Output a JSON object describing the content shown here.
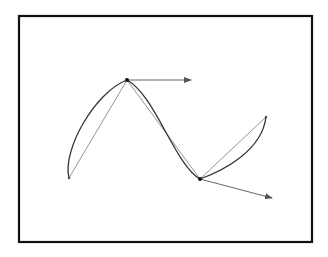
{
  "diagram": {
    "type": "bezier-curve-with-tangents",
    "frame": {
      "x": 19,
      "y": 16,
      "width": 293,
      "height": 226,
      "stroke": "#111111",
      "stroke_width": 2.2
    },
    "points": {
      "start": {
        "x": 69,
        "y": 178
      },
      "peak": {
        "x": 127,
        "y": 80
      },
      "valley": {
        "x": 200,
        "y": 179
      },
      "end": {
        "x": 266,
        "y": 117
      }
    },
    "tangents": [
      {
        "from": {
          "x": 127,
          "y": 80
        },
        "to": {
          "x": 191,
          "y": 80
        }
      },
      {
        "from": {
          "x": 200,
          "y": 179
        },
        "to": {
          "x": 272,
          "y": 198
        }
      }
    ],
    "colors": {
      "curve": "#333333",
      "chord": "#777777",
      "arrow": "#555555",
      "node": "#111111"
    }
  }
}
